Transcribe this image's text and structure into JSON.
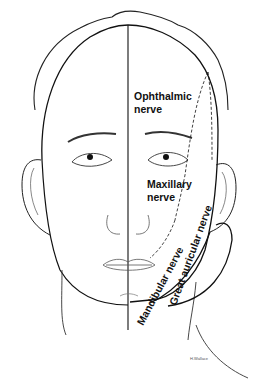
{
  "diagram": {
    "labels": {
      "ophthalmic_line1": "Ophthalmic",
      "ophthalmic_line2": "nerve",
      "maxillary_line1": "Maxillary",
      "maxillary_line2": "nerve",
      "mandibular": "Mandibular nerve",
      "great_auricular": "Great auricular nerve"
    },
    "signature": "H.Wallace",
    "colors": {
      "line": "#111111",
      "background": "#ffffff"
    }
  }
}
